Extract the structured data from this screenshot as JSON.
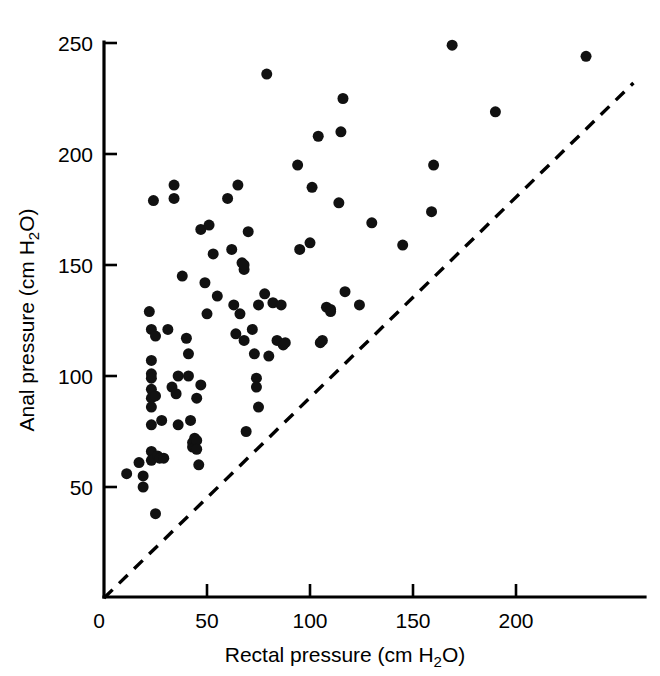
{
  "figure": {
    "background_color": "#ffffff",
    "ink_color": "#000000"
  },
  "chart_data": {
    "type": "scatter",
    "title": "",
    "subtitle": "",
    "xlabel": "Rectal pressure (cm H2O)",
    "xlabel_parts": {
      "pre": "Rectal pressure (cm H",
      "sub": "2",
      "post": "O)"
    },
    "ylabel": "Anal pressure (cm H2O)",
    "ylabel_parts": {
      "pre": "Anal pressure (cm H",
      "sub": "2",
      "post": "O)"
    },
    "xlim": [
      0,
      258
    ],
    "ylim": [
      0,
      270
    ],
    "xticks": [
      0,
      50,
      100,
      150,
      200
    ],
    "xtick_labels": [
      "0",
      "50",
      "100",
      "150",
      "200"
    ],
    "yticks": [
      50,
      100,
      150,
      200,
      250
    ],
    "ytick_labels": [
      "50",
      "100",
      "150",
      "200",
      "250"
    ],
    "grid": false,
    "legend": null,
    "marker": {
      "shape": "circle",
      "color": "#111111",
      "size_px": 11
    },
    "annotations": [
      {
        "kind": "reference-line",
        "name": "line-of-identity",
        "style": "dashed",
        "from": [
          0,
          0
        ],
        "to": [
          257,
          232
        ],
        "description": "dashed line of identity from origin toward upper right"
      }
    ],
    "series": [
      {
        "name": "patients",
        "n": 112,
        "points": [
          [
            11,
            56
          ],
          [
            17,
            61
          ],
          [
            19,
            55
          ],
          [
            19,
            50
          ],
          [
            22,
            129
          ],
          [
            23,
            121
          ],
          [
            23,
            107
          ],
          [
            23,
            101
          ],
          [
            23,
            99
          ],
          [
            23,
            94
          ],
          [
            23,
            90
          ],
          [
            23,
            86
          ],
          [
            23,
            78
          ],
          [
            23,
            66
          ],
          [
            23,
            62
          ],
          [
            24,
            179
          ],
          [
            25,
            118
          ],
          [
            25,
            91
          ],
          [
            25,
            38
          ],
          [
            26,
            64
          ],
          [
            27,
            63
          ],
          [
            28,
            80
          ],
          [
            29,
            63
          ],
          [
            31,
            121
          ],
          [
            33,
            95
          ],
          [
            34,
            186
          ],
          [
            34,
            180
          ],
          [
            35,
            92
          ],
          [
            36,
            100
          ],
          [
            36,
            78
          ],
          [
            38,
            145
          ],
          [
            40,
            117
          ],
          [
            41,
            110
          ],
          [
            41,
            100
          ],
          [
            42,
            80
          ],
          [
            43,
            70
          ],
          [
            43,
            68
          ],
          [
            44,
            72
          ],
          [
            44,
            70
          ],
          [
            44,
            68
          ],
          [
            45,
            90
          ],
          [
            45,
            71
          ],
          [
            45,
            67
          ],
          [
            46,
            60
          ],
          [
            47,
            166
          ],
          [
            47,
            96
          ],
          [
            49,
            142
          ],
          [
            50,
            128
          ],
          [
            51,
            168
          ],
          [
            53,
            155
          ],
          [
            55,
            136
          ],
          [
            60,
            180
          ],
          [
            62,
            157
          ],
          [
            63,
            132
          ],
          [
            64,
            119
          ],
          [
            65,
            186
          ],
          [
            66,
            128
          ],
          [
            67,
            151
          ],
          [
            68,
            148
          ],
          [
            68,
            150
          ],
          [
            68,
            116
          ],
          [
            69,
            75
          ],
          [
            70,
            165
          ],
          [
            72,
            121
          ],
          [
            73,
            110
          ],
          [
            74,
            99
          ],
          [
            74,
            95
          ],
          [
            75,
            132
          ],
          [
            75,
            86
          ],
          [
            78,
            137
          ],
          [
            79,
            236
          ],
          [
            80,
            109
          ],
          [
            82,
            133
          ],
          [
            84,
            116
          ],
          [
            86,
            132
          ],
          [
            87,
            114
          ],
          [
            88,
            115
          ],
          [
            94,
            195
          ],
          [
            95,
            157
          ],
          [
            100,
            160
          ],
          [
            101,
            185
          ],
          [
            104,
            208
          ],
          [
            105,
            115
          ],
          [
            106,
            116
          ],
          [
            108,
            131
          ],
          [
            110,
            130
          ],
          [
            110,
            129
          ],
          [
            114,
            178
          ],
          [
            115,
            210
          ],
          [
            116,
            225
          ],
          [
            117,
            138
          ],
          [
            124,
            132
          ],
          [
            130,
            169
          ],
          [
            145,
            159
          ],
          [
            159,
            174
          ],
          [
            160,
            195
          ],
          [
            169,
            249
          ],
          [
            190,
            219
          ],
          [
            234,
            244
          ]
        ]
      }
    ]
  },
  "caption": {
    "fragment": ""
  }
}
